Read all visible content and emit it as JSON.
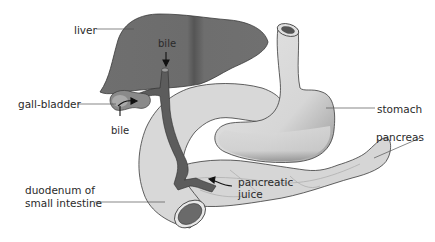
{
  "labels": {
    "liver": "liver",
    "bile_top": "bile",
    "gall_bladder": "gall-bladder",
    "bile_left": "bile",
    "stomach": "stomach",
    "pancreas": "pancreas",
    "duodenum_line1": "duodenum of",
    "duodenum_line2": "small intestine",
    "pancreatic_line1": "pancreatic",
    "pancreatic_line2": "juice"
  },
  "colors": {
    "liver": "#6e6e6e",
    "duct": "#5a5a5a",
    "organ_light": "#d9d9d9",
    "stomach": "#dcdcdc",
    "outline": "#3a3a3a",
    "background": "#ffffff"
  }
}
